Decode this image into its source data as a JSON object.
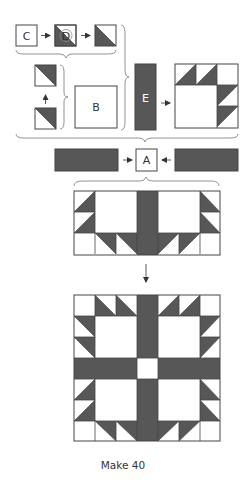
{
  "diagram": {
    "colors": {
      "dark": "#575757",
      "outline": "#444444",
      "light": "#ffffff",
      "text": "#333333"
    },
    "pieces": {
      "A": {
        "label": "A"
      },
      "B": {
        "label": "B"
      },
      "C": {
        "label": "C"
      },
      "D": {
        "label": "D"
      },
      "E": {
        "label": "E"
      }
    },
    "steps": [
      {
        "id": "step-1",
        "description": "Place D on C, stitch on diagonal, trim to make half-square triangle"
      },
      {
        "id": "step-2",
        "description": "Join two half-square triangle units"
      },
      {
        "id": "step-3",
        "description": "Join triangle units to B to form corner unit"
      },
      {
        "id": "step-4",
        "description": "Add E strip to corner unit"
      },
      {
        "id": "step-5",
        "description": "Join sashing strips to A"
      },
      {
        "id": "step-6",
        "description": "Join units into half-block rows"
      },
      {
        "id": "step-7",
        "description": "Assemble complete block"
      }
    ],
    "caption": "Make 40"
  }
}
